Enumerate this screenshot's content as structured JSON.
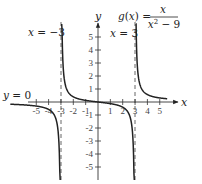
{
  "chart_data": {
    "type": "line",
    "title": "",
    "function_label": "g(x) = x / (x^2 - 9)",
    "function_name": "g(x)",
    "numerator": "x",
    "denominator": "x² − 9",
    "xlabel": "x",
    "ylabel": "y",
    "xlim": [
      -6.5,
      6.5
    ],
    "ylim": [
      -6,
      6
    ],
    "x_ticks": [
      -5,
      -4,
      -3,
      -2,
      -1,
      1,
      2,
      3,
      4,
      5
    ],
    "y_ticks": [
      -5,
      -4,
      -3,
      -2,
      -1,
      1,
      2,
      3,
      4,
      5
    ],
    "x_tick_labels": [
      "-5",
      "-4",
      "-3",
      "-2",
      "-1",
      "1",
      "2",
      "3",
      "4",
      "5"
    ],
    "y_tick_labels": [
      "5",
      "4",
      "3",
      "2",
      "1",
      "-1",
      "-2",
      "-3",
      "-4",
      "-5"
    ],
    "grid": false,
    "legend": null,
    "asymptotes": {
      "vertical": [
        {
          "x": -3,
          "label": "x = −3"
        },
        {
          "x": 3,
          "label": "x = 3"
        }
      ],
      "horizontal": [
        {
          "y": 0,
          "label": "y = 0"
        }
      ]
    },
    "series": [
      {
        "name": "g(x) left branch",
        "domain": [
          -7,
          -3
        ],
        "x": [
          -7,
          -6,
          -5,
          -4,
          -3.5,
          -3.2,
          -3.1
        ],
        "y": [
          -0.175,
          -0.222,
          -0.3125,
          -0.571,
          -1.077,
          -2.581,
          -5.082
        ]
      },
      {
        "name": "g(x) middle branch",
        "domain": [
          -3,
          3
        ],
        "x": [
          -2.9,
          -2.8,
          -2.5,
          -2,
          -1,
          0,
          1,
          2,
          2.5,
          2.8,
          2.9
        ],
        "y": [
          4.932,
          2.414,
          0.909,
          0.4,
          0.125,
          0,
          -0.125,
          -0.4,
          -0.909,
          -2.414,
          -4.932
        ]
      },
      {
        "name": "g(x) right branch",
        "domain": [
          3,
          7
        ],
        "x": [
          3.1,
          3.2,
          3.5,
          4,
          5,
          6,
          7
        ],
        "y": [
          5.082,
          2.581,
          1.077,
          0.571,
          0.3125,
          0.222,
          0.175
        ]
      }
    ]
  },
  "labels": {
    "x_axis": "x",
    "y_axis": "y",
    "left_asymptote": "x = −3",
    "right_asymptote": "x = 3",
    "horizontal_asymptote": "y = 0",
    "func_lhs": "g(x) =",
    "func_num": "x",
    "func_den": "x² − 9"
  }
}
